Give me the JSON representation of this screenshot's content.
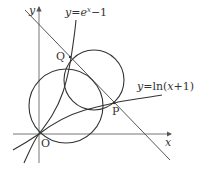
{
  "diagram": {
    "type": "coordinate-geometry",
    "axes": {
      "x_label": "x",
      "y_label": "y",
      "origin_label": "O"
    },
    "curves": [
      {
        "name": "exp-curve",
        "label_prefix": "y=e",
        "label_sup": "x",
        "label_suffix": "−1"
      },
      {
        "name": "ln-curve",
        "label_prefix": "y=ln",
        "label_arg": "(x+1)"
      }
    ],
    "points": [
      {
        "name": "Q",
        "label": "Q"
      },
      {
        "name": "P",
        "label": "P"
      },
      {
        "name": "O",
        "label": "O"
      }
    ],
    "elements": [
      "two circles",
      "straight line through Q and P"
    ],
    "colors": {
      "stroke": "#333333",
      "axis": "#555555",
      "background": "#ffffff"
    }
  }
}
